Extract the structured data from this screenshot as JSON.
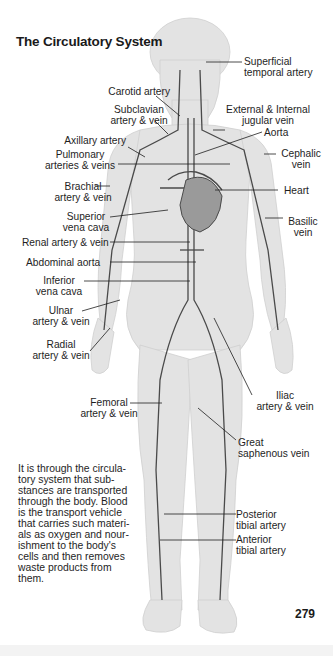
{
  "title": "The Circulatory System",
  "labels": {
    "superficial_temporal_artery": "Superficial\ntemporal artery",
    "carotid_artery": "Carotid artery",
    "subclavian": "Subclavian\nartery & vein",
    "jugular": "External & Internal\njugular vein",
    "aorta": "Aorta",
    "axillary_artery": "Axillary artery",
    "pulmonary": "Pulmonary\narteries & veins",
    "cephalic_vein": "Cephalic\nvein",
    "brachial": "Brachial\nartery & vein",
    "heart": "Heart",
    "superior_vena_cava": "Superior\nvena cava",
    "basilic_vein": "Basilic\nvein",
    "renal": "Renal artery & vein",
    "abdominal_aorta": "Abdominal aorta",
    "inferior_vena_cava": "Inferior\nvena cava",
    "ulnar": "Ulnar\nartery & vein",
    "radial": "Radial\nartery & vein",
    "iliac": "Iliac\nartery & vein",
    "femoral": "Femoral\nartery & vein",
    "great_saphenous": "Great\nsaphenous vein",
    "posterior_tibial": "Posterior\ntibial artery",
    "anterior_tibial": "Anterior\ntibial artery"
  },
  "description": "It is through the circula-\ntory system that sub-\nstances are transported\nthrough the body. Blood\nis the transport vehicle\nthat carries such materi-\nals as oxygen and nour-\nishment to the body's\ncells and then removes\nwaste products from\nthem.",
  "page_number": "279",
  "colors": {
    "body_fill": "#e2e2e2",
    "vessel": "#4a4a4a",
    "text": "#1e1e1e",
    "background": "#ffffff"
  }
}
